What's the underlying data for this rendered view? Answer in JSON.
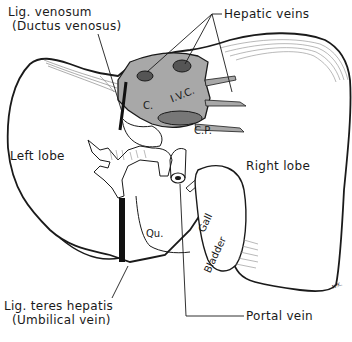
{
  "diagram": {
    "colors": {
      "ink": "#1a1a1a",
      "shading": "#9a9a9a",
      "background": "#ffffff"
    },
    "labels": {
      "lig_venosum_line1": "Lig. venosum",
      "lig_venosum_line2": "(Ductus venosus)",
      "hepatic_veins": "Hepatic veins",
      "caudate": "C.",
      "ivc": "I.V.C.",
      "caudate_process": "C.P.",
      "left_lobe": "Left lobe",
      "right_lobe": "Right lobe",
      "quadrate": "Qu.",
      "gall": "Gall",
      "bladder": "Bladder",
      "lig_teres_line1": "Lig. teres hepatis",
      "lig_teres_line2": "(Umbilical vein)",
      "portal_vein": "Portal vein",
      "signature": "N.K."
    }
  }
}
